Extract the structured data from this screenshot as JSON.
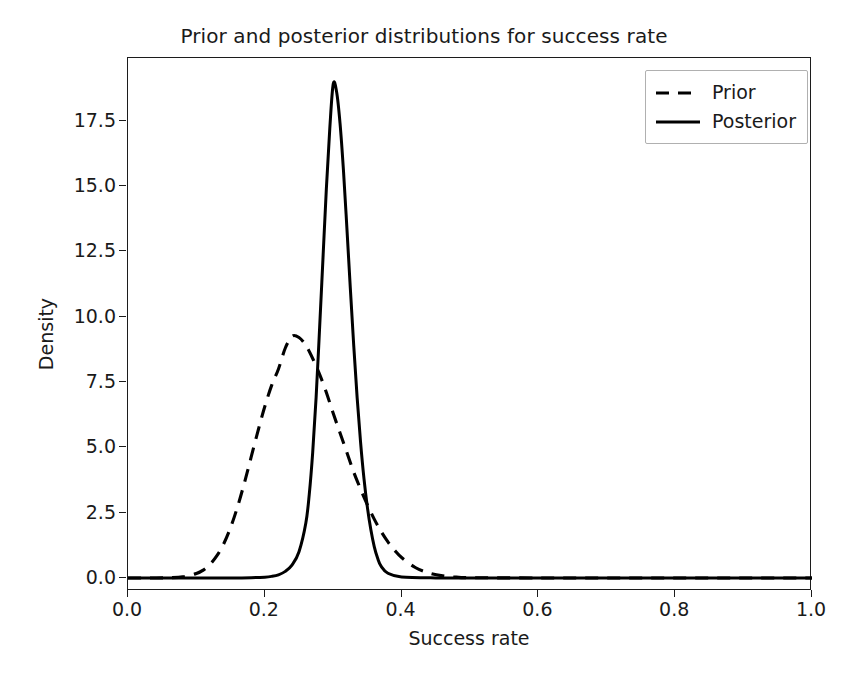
{
  "chart_data": {
    "type": "line",
    "title": "Prior and posterior distributions for success rate",
    "xlabel": "Success rate",
    "ylabel": "Density",
    "xlim": [
      0.0,
      1.0
    ],
    "ylim": [
      -0.5,
      19.9
    ],
    "grid": false,
    "legend_position": "upper right",
    "xticks": [
      "0.0",
      "0.2",
      "0.4",
      "0.6",
      "0.8",
      "1.0"
    ],
    "xtick_values": [
      0.0,
      0.2,
      0.4,
      0.6,
      0.8,
      1.0
    ],
    "yticks": [
      "0.0",
      "2.5",
      "5.0",
      "7.5",
      "10.0",
      "12.5",
      "15.0",
      "17.5"
    ],
    "ytick_values": [
      0.0,
      2.5,
      5.0,
      7.5,
      10.0,
      12.5,
      15.0,
      17.5
    ],
    "series": [
      {
        "name": "Prior",
        "style": "dashed",
        "color": "#000000",
        "peak_x": 0.24,
        "peak_y": 9.3,
        "x": [
          0.0,
          0.02,
          0.04,
          0.06,
          0.08,
          0.1,
          0.11,
          0.12,
          0.13,
          0.14,
          0.15,
          0.16,
          0.17,
          0.18,
          0.19,
          0.2,
          0.21,
          0.22,
          0.23,
          0.24,
          0.25,
          0.26,
          0.27,
          0.28,
          0.29,
          0.3,
          0.31,
          0.32,
          0.33,
          0.34,
          0.35,
          0.36,
          0.37,
          0.38,
          0.39,
          0.4,
          0.42,
          0.44,
          0.46,
          0.48,
          0.5,
          0.6,
          0.7,
          0.8,
          0.9,
          1.0
        ],
        "y": [
          0.0,
          0.0,
          0.0,
          0.01,
          0.04,
          0.17,
          0.3,
          0.52,
          0.85,
          1.31,
          1.93,
          2.71,
          3.62,
          4.62,
          5.62,
          6.56,
          7.37,
          8.0,
          8.8,
          9.25,
          9.2,
          8.9,
          8.4,
          7.8,
          7.1,
          6.3,
          5.55,
          4.8,
          4.05,
          3.4,
          2.8,
          2.25,
          1.78,
          1.38,
          1.05,
          0.78,
          0.4,
          0.19,
          0.08,
          0.03,
          0.01,
          0.0,
          0.0,
          0.0,
          0.0,
          0.0
        ]
      },
      {
        "name": "Posterior",
        "style": "solid",
        "color": "#000000",
        "peak_x": 0.3,
        "peak_y": 19.0,
        "x": [
          0.0,
          0.05,
          0.1,
          0.15,
          0.18,
          0.2,
          0.21,
          0.22,
          0.23,
          0.24,
          0.25,
          0.26,
          0.265,
          0.27,
          0.275,
          0.28,
          0.285,
          0.29,
          0.295,
          0.3,
          0.305,
          0.31,
          0.315,
          0.32,
          0.325,
          0.33,
          0.335,
          0.34,
          0.345,
          0.35,
          0.355,
          0.36,
          0.365,
          0.37,
          0.38,
          0.4,
          0.45,
          0.5,
          0.6,
          0.7,
          0.8,
          0.9,
          1.0
        ],
        "y": [
          0.0,
          0.0,
          0.0,
          0.0,
          0.01,
          0.03,
          0.06,
          0.12,
          0.25,
          0.5,
          1.0,
          2.1,
          3.2,
          4.8,
          6.9,
          9.5,
          12.2,
          14.9,
          17.2,
          18.9,
          18.6,
          17.4,
          15.6,
          13.4,
          11.1,
          8.9,
          6.9,
          5.2,
          3.8,
          2.7,
          1.85,
          1.2,
          0.75,
          0.45,
          0.18,
          0.04,
          0.0,
          0.0,
          0.0,
          0.0,
          0.0,
          0.0,
          0.0
        ]
      }
    ]
  },
  "legend": {
    "items": [
      {
        "label": "Prior"
      },
      {
        "label": "Posterior"
      }
    ]
  },
  "axes": {
    "x_label": "Success rate",
    "y_label": "Density"
  },
  "title": "Prior and posterior distributions for success rate"
}
